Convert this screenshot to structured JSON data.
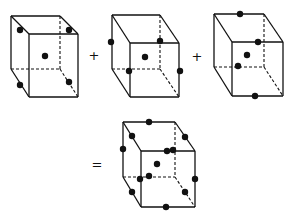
{
  "diagram": {
    "operators": [
      {
        "symbol": "+",
        "x": 94,
        "y": 60
      },
      {
        "symbol": "+",
        "x": 197,
        "y": 61
      },
      {
        "symbol": "=",
        "x": 97,
        "y": 169
      }
    ],
    "cubes": [
      {
        "id": "cube-1",
        "back": {
          "tl": [
            11,
            16
          ],
          "tr": [
            60,
            16
          ],
          "br": [
            60,
            69
          ],
          "bl": [
            11,
            69
          ]
        },
        "front": {
          "tl": [
            29,
            34
          ],
          "tr": [
            78,
            34
          ],
          "br": [
            78,
            97
          ],
          "bl": [
            29,
            97
          ]
        },
        "dots": [
          [
            20,
            30
          ],
          [
            69,
            30
          ],
          [
            45,
            56
          ],
          [
            20,
            85
          ],
          [
            69,
            82
          ]
        ]
      },
      {
        "id": "cube-2",
        "back": {
          "tl": [
            112,
            15
          ],
          "tr": [
            160,
            15
          ],
          "br": [
            160,
            69
          ],
          "bl": [
            112,
            69
          ]
        },
        "front": {
          "tl": [
            130,
            43
          ],
          "tr": [
            179,
            43
          ],
          "br": [
            179,
            97
          ],
          "bl": [
            130,
            97
          ]
        },
        "dots": [
          [
            111,
            42
          ],
          [
            160,
            41
          ],
          [
            145,
            57
          ],
          [
            129,
            71
          ],
          [
            180,
            71
          ]
        ]
      },
      {
        "id": "cube-3",
        "back": {
          "tl": [
            214,
            14
          ],
          "tr": [
            264,
            14
          ],
          "br": [
            264,
            67
          ],
          "bl": [
            214,
            67
          ]
        },
        "front": {
          "tl": [
            232,
            42
          ],
          "tr": [
            283,
            42
          ],
          "br": [
            283,
            96
          ],
          "bl": [
            232,
            96
          ]
        },
        "dots": [
          [
            240,
            14
          ],
          [
            258,
            42
          ],
          [
            247,
            55
          ],
          [
            238,
            66
          ],
          [
            255,
            96
          ]
        ]
      },
      {
        "id": "cube-result",
        "back": {
          "tl": [
            123,
            122
          ],
          "tr": [
            175,
            122
          ],
          "br": [
            175,
            177
          ],
          "bl": [
            123,
            177
          ]
        },
        "front": {
          "tl": [
            141,
            151
          ],
          "tr": [
            195,
            151
          ],
          "br": [
            195,
            207
          ],
          "bl": [
            141,
            207
          ]
        },
        "dots": [
          [
            149,
            122
          ],
          [
            132,
            136
          ],
          [
            185,
            137
          ],
          [
            123,
            149
          ],
          [
            173,
            150
          ],
          [
            167,
            151
          ],
          [
            157,
            164
          ],
          [
            149,
            176
          ],
          [
            140,
            179
          ],
          [
            195,
            179
          ],
          [
            132,
            192
          ],
          [
            185,
            192
          ],
          [
            166,
            207
          ]
        ]
      }
    ]
  }
}
